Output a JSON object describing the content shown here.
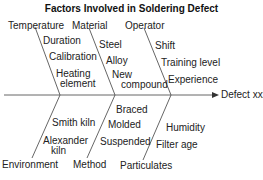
{
  "title": "Factors Involved in Soldering Defect",
  "effect": "Defect xxx",
  "line_color": "#555555",
  "categories": {
    "temperature": {
      "label": "Temperature",
      "causes": [
        "Duration",
        "Calibration",
        "Heating",
        "element"
      ]
    },
    "material": {
      "label": "Material",
      "causes": [
        "Steel",
        "Alloy",
        "New",
        "compound"
      ]
    },
    "operator": {
      "label": "Operator",
      "causes": [
        "Shift",
        "Training level",
        "Experience"
      ]
    },
    "environment": {
      "label": "Environment",
      "causes": [
        "Smith kiln",
        "Alexander",
        "kiln"
      ]
    },
    "method": {
      "label": "Method",
      "causes": [
        "Braced",
        "Molded",
        "Suspended"
      ]
    },
    "particulates": {
      "label": "Particulates",
      "causes": [
        "Humidity",
        "Filter age"
      ]
    }
  }
}
